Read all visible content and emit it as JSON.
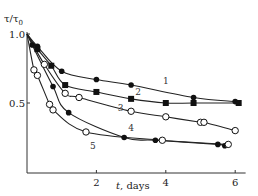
{
  "chart_data": {
    "type": "line",
    "title": "",
    "xlabel": "t, days",
    "ylabel": "τ/τ0",
    "xlim": [
      0,
      6.3
    ],
    "ylim": [
      0,
      1.0
    ],
    "x_ticks": [
      2,
      4,
      6
    ],
    "y_ticks": [
      0.5,
      1.0
    ],
    "x_tick_labels": [
      "2",
      "4",
      "6"
    ],
    "y_tick_labels": [
      "0.5",
      "1.0"
    ],
    "grid": false,
    "legend": "inline curve numbers",
    "series": [
      {
        "name": "1",
        "marker": "filled-circle",
        "x": [
          0,
          0.3,
          1.0,
          2.0,
          3.0,
          4.8,
          6.0
        ],
        "y": [
          1.0,
          0.91,
          0.73,
          0.67,
          0.63,
          0.54,
          0.51
        ]
      },
      {
        "name": "2",
        "marker": "filled-square",
        "x": [
          0,
          0.3,
          0.7,
          1.1,
          2.0,
          3.0,
          4.0,
          4.8,
          6.1
        ],
        "y": [
          1.0,
          0.89,
          0.77,
          0.63,
          0.58,
          0.53,
          0.5,
          0.5,
          0.5
        ]
      },
      {
        "name": "3",
        "marker": "open-circle",
        "x": [
          0,
          0.5,
          1.1,
          1.5,
          3.0,
          4.0,
          5.0,
          5.1,
          6.0
        ],
        "y": [
          1.0,
          0.78,
          0.57,
          0.54,
          0.44,
          0.4,
          0.36,
          0.36,
          0.3
        ]
      },
      {
        "name": "4",
        "marker": "filled-circle",
        "x": [
          0,
          0.15,
          0.75,
          1.2,
          2.8,
          3.7,
          5.5,
          5.7
        ],
        "y": [
          1.0,
          0.92,
          0.62,
          0.43,
          0.25,
          0.23,
          0.2,
          0.19
        ]
      },
      {
        "name": "5",
        "marker": "open-circle",
        "x": [
          0,
          0.2,
          0.3,
          0.65,
          0.75,
          1.7,
          3.9,
          5.8
        ],
        "y": [
          1.0,
          0.74,
          0.7,
          0.49,
          0.45,
          0.29,
          0.23,
          0.2
        ]
      }
    ],
    "annotations": [
      {
        "text": "1",
        "x": 4.0,
        "y": 0.64
      },
      {
        "text": "2",
        "x": 3.2,
        "y": 0.56
      },
      {
        "text": "3",
        "x": 2.7,
        "y": 0.44
      },
      {
        "text": "4",
        "x": 3.0,
        "y": 0.3
      },
      {
        "text": "5",
        "x": 1.9,
        "y": 0.17
      }
    ]
  }
}
